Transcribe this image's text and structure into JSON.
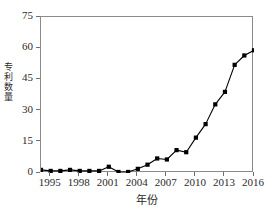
{
  "chart_data": {
    "type": "line",
    "title": "",
    "xlabel": "年份",
    "ylabel": "专利数量",
    "xlim": [
      1994,
      2016
    ],
    "ylim": [
      0,
      75
    ],
    "grid": false,
    "legend": null,
    "marker": "square",
    "line_color": "#000000",
    "marker_color": "#000000",
    "x_ticks": [
      1995,
      1998,
      2001,
      2004,
      2007,
      2010,
      2013,
      2016
    ],
    "y_ticks": [
      0,
      15,
      30,
      45,
      60,
      75
    ],
    "x": [
      1994,
      1995,
      1996,
      1997,
      1998,
      1999,
      2000,
      2001,
      2002,
      2003,
      2004,
      2005,
      2006,
      2007,
      2008,
      2009,
      2010,
      2011,
      2012,
      2013,
      2014,
      2015,
      2016
    ],
    "series": [
      {
        "name": "专利数量",
        "values": [
          1.5,
          1,
          1,
          1.5,
          1,
          1,
          1,
          3,
          0.5,
          0.5,
          2,
          4,
          7,
          6.5,
          11,
          10,
          17,
          23.5,
          33,
          39,
          52,
          56.5,
          59
        ]
      }
    ]
  }
}
